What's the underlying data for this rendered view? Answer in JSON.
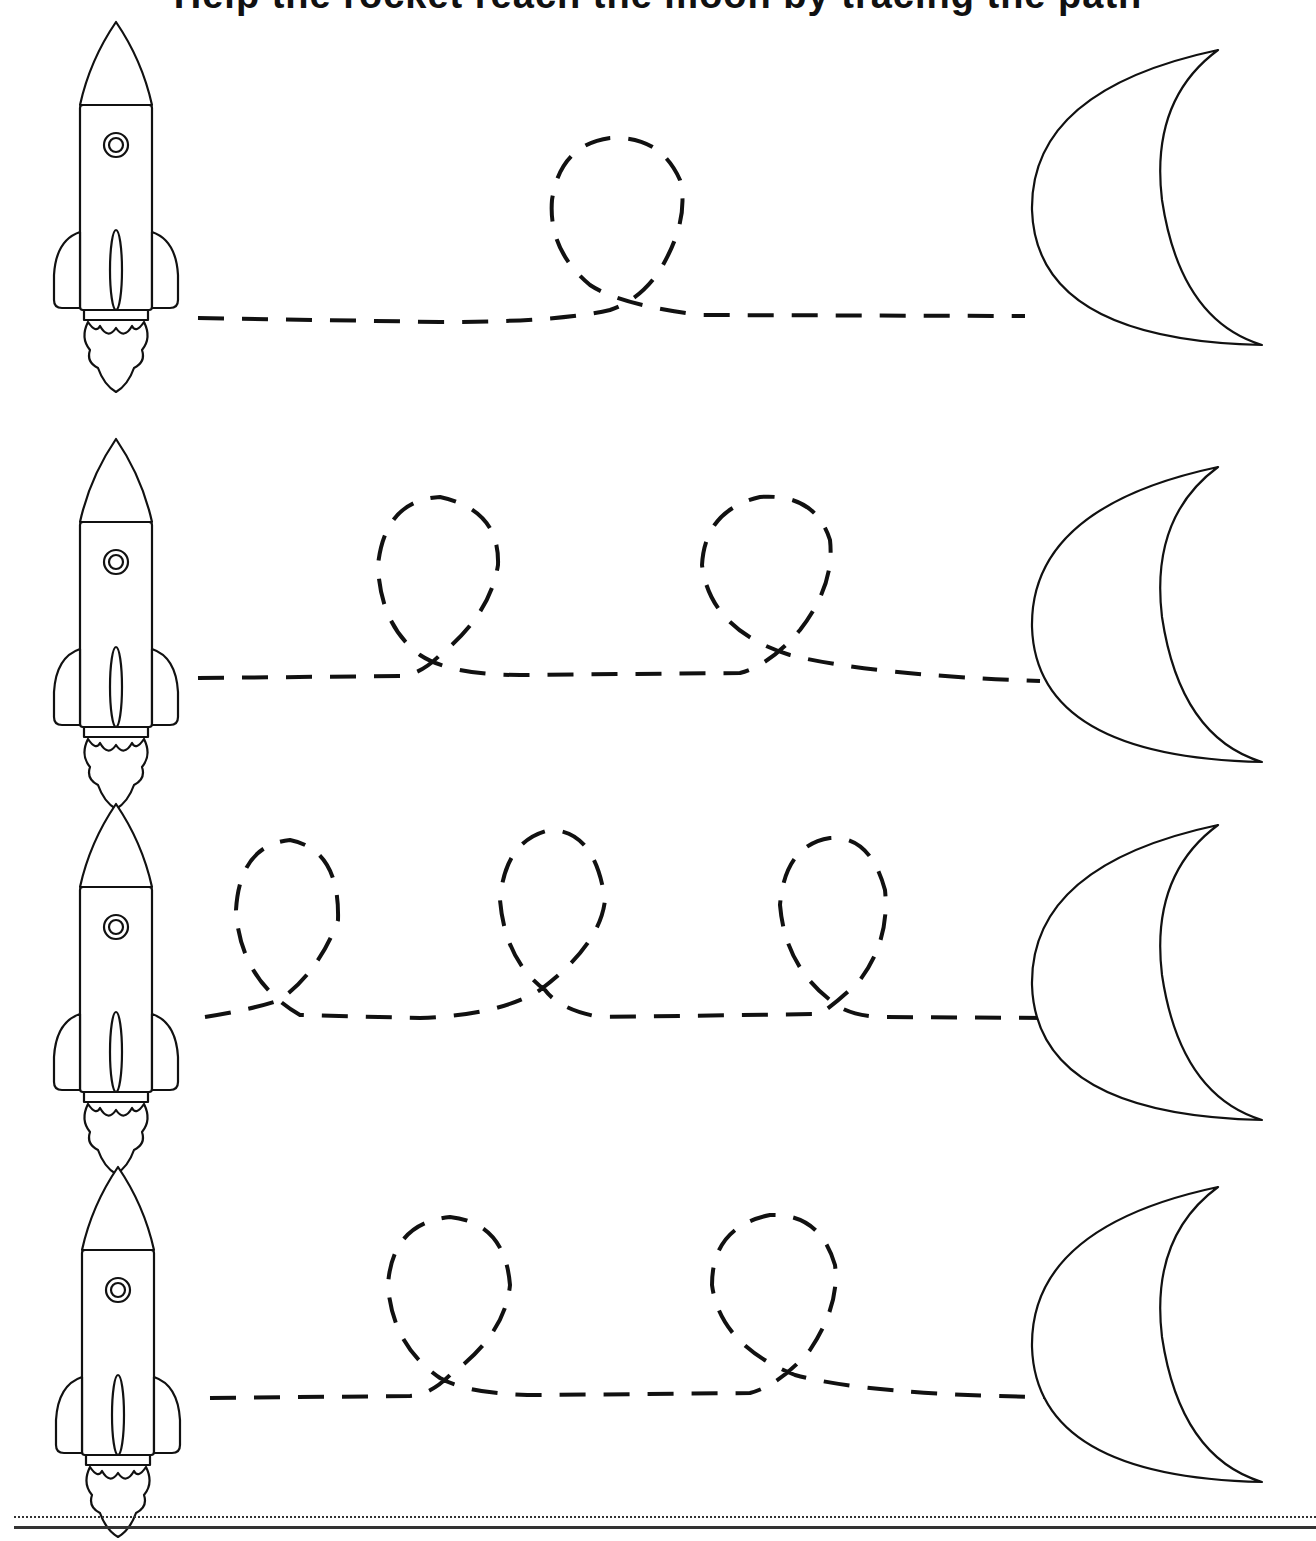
{
  "worksheet": {
    "title": "Help the rocket reach the moon by tracing the path",
    "instruction_visible": false,
    "ink_color": "#111111",
    "background": "#ffffff",
    "rows": [
      {
        "index": 1,
        "start": "rocket",
        "end": "crescent-moon",
        "loops": 1
      },
      {
        "index": 2,
        "start": "rocket",
        "end": "crescent-moon",
        "loops": 2
      },
      {
        "index": 3,
        "start": "rocket",
        "end": "crescent-moon",
        "loops": 3
      },
      {
        "index": 4,
        "start": "rocket",
        "end": "crescent-moon",
        "loops": 2
      }
    ],
    "footer": {
      "lines": [
        "dotted-guide",
        "solid-baseline"
      ]
    }
  }
}
